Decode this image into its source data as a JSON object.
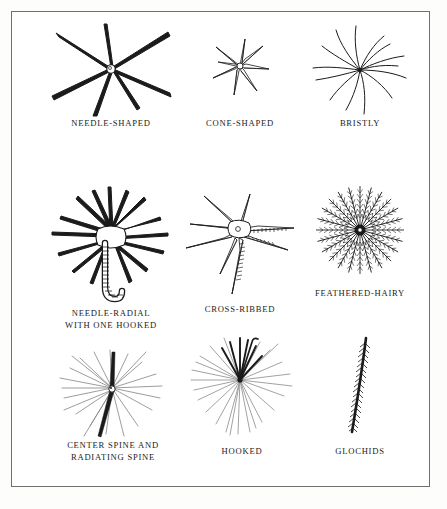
{
  "plate": {
    "title": "Cactus Spine Types",
    "background_color": "#ffffff",
    "page_color": "#fdfdfb",
    "border_color": "#6f6f6f",
    "ink_color": "#1b1b1b",
    "label_color": "#1b1b1b",
    "columns": 3,
    "rows": 3
  },
  "figures": [
    {
      "id": "needle-shaped",
      "label_lines": [
        "NEEDLE-SHAPED"
      ],
      "description": "Several long, straight, stiff needle-like spines radiating from a small round areole",
      "spine_count": 7,
      "style": "straight-tapered",
      "center_x": 110,
      "center_y": 68
    },
    {
      "id": "cone-shaped",
      "label_lines": [
        "CONE-SHAPED"
      ],
      "description": "Short, thick, broadly tapered conical spines forming a compact star",
      "spine_count": 7,
      "style": "short-conical",
      "center_x": 240,
      "center_y": 68
    },
    {
      "id": "bristly",
      "label_lines": [
        "BRISTLY"
      ],
      "description": "Many fine, soft, curving hair-like bristles spreading outward",
      "spine_count": 13,
      "style": "curved-hair",
      "center_x": 360,
      "center_y": 70
    },
    {
      "id": "needle-radial-with-one-hooked",
      "label_lines": [
        "NEEDLE-RADIAL",
        "WITH ONE HOOKED"
      ],
      "description": "Radiating needle spines above a stout cross-banded central spine that curves into a hook",
      "spine_count": 15,
      "style": "radial-plus-hooked-central",
      "center_x": 110,
      "center_y": 233
    },
    {
      "id": "cross-ribbed",
      "label_lines": [
        "CROSS-RIBBED"
      ],
      "description": "Broad flattened tapering spines marked with transverse ribs or cross bands",
      "spine_count": 8,
      "style": "flat-ribbed",
      "center_x": 238,
      "center_y": 228
    },
    {
      "id": "feathered-hairy",
      "label_lines": [
        "FEATHERED-HAIRY"
      ],
      "description": "Radiating spines each fringed with fine lateral barbs giving a plumose feathered look",
      "spine_count": 24,
      "style": "plumose",
      "center_x": 360,
      "center_y": 230
    },
    {
      "id": "center-spine-and-radiating-spine",
      "label_lines": [
        "CENTER SPINE AND",
        "RADIATING SPINE"
      ],
      "description": "A dense halo of slender radiating spines with one dark prominent central spine",
      "spine_count": 22,
      "style": "radial-plus-center",
      "center_x": 112,
      "center_y": 389
    },
    {
      "id": "hooked",
      "label_lines": [
        "HOOKED"
      ],
      "description": "Dense radiating spines with several dark upward central spines, one tipped with a hook",
      "spine_count": 28,
      "style": "dense-radial-hooked",
      "center_x": 240,
      "center_y": 381
    },
    {
      "id": "glochids",
      "label_lines": [
        "GLOCHIDS"
      ],
      "description": "A single slender barbed bristle covered with minute backward-pointing barbs",
      "spine_count": 1,
      "style": "barbed-bristle",
      "center_x": 360,
      "center_y": 390
    }
  ]
}
